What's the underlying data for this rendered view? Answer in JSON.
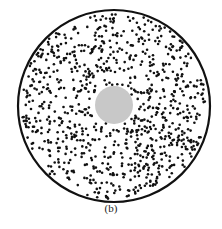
{
  "figure": {
    "caption": "(b)",
    "outer_circle": {
      "cx": 114,
      "cy": 106,
      "r": 96,
      "stroke": "#111111",
      "stroke_width": 2.2,
      "fill": "#ffffff"
    },
    "center_disk": {
      "cx": 114,
      "cy": 105,
      "r": 19,
      "fill": "#c8c8c8"
    },
    "particles": {
      "count": 900,
      "radius": 1.3,
      "color": "#111111",
      "seed": 7,
      "exclusion_radius": 20
    }
  }
}
